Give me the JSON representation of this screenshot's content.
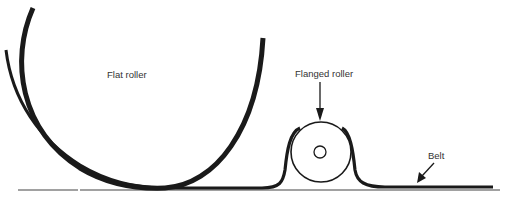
{
  "diagram": {
    "labels": {
      "flat_roller": "Flat roller",
      "flanged_roller": "Flanged roller",
      "belt": "Belt"
    },
    "colors": {
      "stroke": "#1a1a1a",
      "text": "#333333",
      "background": "#ffffff"
    }
  }
}
